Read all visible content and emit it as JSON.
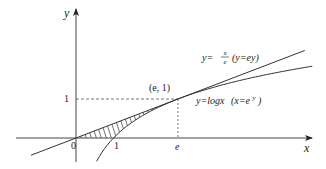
{
  "diagram": {
    "axes": {
      "x_label": "x",
      "y_label": "y",
      "origin_label": "0"
    },
    "ticks": {
      "x_one": "1",
      "x_e": "e",
      "y_one": "1"
    },
    "point_label": "(e,  1)",
    "tangent_label": {
      "lhs": "y=",
      "num": "x",
      "den": "e",
      "alt": "(y=ey)"
    },
    "log_label": {
      "main": "y=logx",
      "alt_open": "(x=e",
      "alt_sup": "y",
      "alt_close": ")"
    },
    "colors": {
      "stroke": "#333333",
      "dashed": "#555555"
    }
  },
  "chart_data": {
    "type": "line",
    "title": "",
    "xlabel": "x",
    "ylabel": "y",
    "series": [
      {
        "name": "y = x/e (tangent line)",
        "function": "x/e",
        "x_range": [
          -1.2,
          6.1
        ]
      },
      {
        "name": "y = log x",
        "function": "ln(x)",
        "x_range": [
          0.55,
          6.3
        ]
      }
    ],
    "annotations": [
      {
        "text": "(e, 1)",
        "x": 2.718,
        "y": 1
      },
      {
        "text": "shaded region between y=x/e and y=log x, x-axis, from x=0 to x=e"
      }
    ],
    "tick_labels": {
      "x": [
        "0",
        "1",
        "e"
      ],
      "y": [
        "1"
      ]
    },
    "grid": false
  }
}
